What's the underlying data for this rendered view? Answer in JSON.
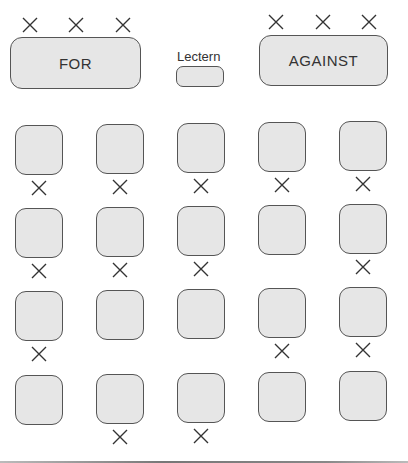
{
  "diagram": {
    "tables": {
      "for": {
        "label": "FOR",
        "markers": 3
      },
      "against": {
        "label": "AGAINST",
        "markers": 3
      },
      "lectern": {
        "label": "Lectern"
      }
    },
    "seat_grid": {
      "rows": 4,
      "cols": 5,
      "marked": [
        [
          true,
          true,
          true,
          true,
          true
        ],
        [
          true,
          true,
          true,
          false,
          true
        ],
        [
          true,
          false,
          false,
          true,
          true
        ],
        [
          false,
          true,
          true,
          false,
          false
        ]
      ]
    },
    "colors": {
      "fill": "#e6e6e6",
      "stroke": "#555555",
      "marker": "#333333"
    }
  }
}
